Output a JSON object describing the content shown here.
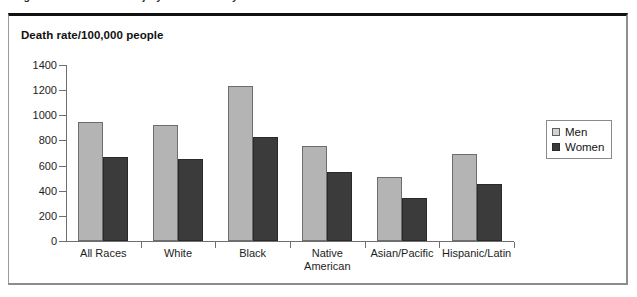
{
  "caption": {
    "text": "Figure 2. Unintentional injury death rates by sex and race in 2005."
  },
  "figure": {
    "title": "Death rate/100,000 people"
  },
  "legend": {
    "position": "right",
    "items": [
      {
        "label": "Men",
        "swatch": "light-gray-swatch",
        "color": "#d2d2d2"
      },
      {
        "label": "Women",
        "swatch": "dark-swatch",
        "color": "#3b3b3b"
      }
    ]
  },
  "chart_data": {
    "type": "bar",
    "title": "Death rate/100,000 people",
    "xlabel": "",
    "ylabel": "Death rate/100,000 people",
    "ylim": [
      0,
      1400
    ],
    "yticks": [
      0,
      200,
      400,
      600,
      800,
      1000,
      1200,
      1400
    ],
    "ytick_labels": [
      "0",
      "200",
      "400",
      "600",
      "800",
      "1000",
      "1200",
      "1400"
    ],
    "grid": false,
    "legend_position": "right",
    "categories": [
      "All Races",
      "White",
      "Black",
      "Native\nAmerican",
      "Asian/Pacific",
      "Hispanic/Latin"
    ],
    "series": [
      {
        "name": "Men",
        "color": "#b4b4b4",
        "values": [
          950,
          925,
          1230,
          755,
          510,
          690
        ]
      },
      {
        "name": "Women",
        "color": "#3b3b3b",
        "values": [
          670,
          655,
          830,
          550,
          345,
          450
        ]
      }
    ]
  }
}
